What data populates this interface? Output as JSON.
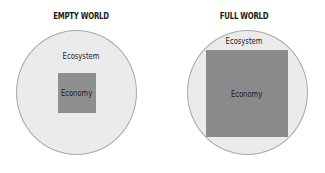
{
  "diagram": {
    "panels": [
      {
        "title": "EMPTY WORLD",
        "outer_label": "Ecosystem",
        "inner_label": "Economy"
      },
      {
        "title": "FULL WORLD",
        "outer_label": "Ecosystem",
        "inner_label": "Economy"
      }
    ],
    "colors": {
      "ecosystem_fill": "#ebebeb",
      "ecosystem_stroke": "#a9a9a9",
      "economy_fill_empty": "#8f8f8f",
      "economy_fill_full": "#8a8a8a",
      "text": "#1a1a1a"
    }
  }
}
